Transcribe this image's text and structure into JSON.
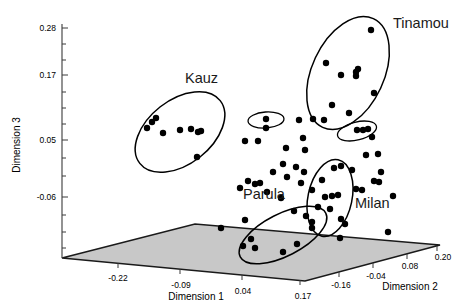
{
  "chart_data": {
    "type": "scatter",
    "title": "",
    "projection": "3d",
    "xlabel": "Dimension 1",
    "ylabel": "Dimension 2",
    "zlabel": "Dimension 3",
    "axes": {
      "dimension_1": {
        "label": "Dimension 1",
        "ticks": [
          "-0.22",
          "-0.09",
          "0.04",
          "0.17"
        ]
      },
      "dimension_2": {
        "label": "Dimension 2",
        "ticks": [
          "-0.16",
          "-0.04",
          "0.08",
          "0.20"
        ]
      },
      "dimension_3": {
        "label": "Dimension 3",
        "ticks": [
          "0.28",
          "0.17",
          "0.05",
          "-0.06"
        ]
      }
    },
    "grid": false,
    "legend_position": "none",
    "floor_plane": {
      "visible": true,
      "color": "#c8c8c8"
    },
    "marker": {
      "shape": "circle",
      "color": "#000000",
      "size": 3.2
    },
    "cluster_labels": [
      "Kauz",
      "Tinamou",
      "Parula",
      "Milan"
    ],
    "clusters": [
      {
        "name": "Kauz",
        "label": "Kauz",
        "label_pos": [
          185,
          83
        ],
        "ellipse": {
          "cx": 180,
          "cy": 132,
          "rx": 51,
          "ry": 32,
          "rotation": -38
        },
        "points": [
          [
            152,
            122
          ],
          [
            156,
            118
          ],
          [
            147,
            128
          ],
          [
            163,
            133
          ],
          [
            180,
            130
          ],
          [
            191,
            129
          ],
          [
            198,
            132
          ],
          [
            201,
            131
          ],
          [
            197,
            157
          ]
        ]
      },
      {
        "name": "Tinamou",
        "label": "Tinamou",
        "label_pos": [
          393,
          28
        ],
        "ellipse": {
          "cx": 348,
          "cy": 73,
          "rx": 36,
          "ry": 60,
          "rotation": 25
        },
        "points": [
          [
            371,
            30
          ],
          [
            326,
            63
          ],
          [
            356,
            72
          ],
          [
            358,
            69
          ],
          [
            356,
            76
          ],
          [
            341,
            75
          ],
          [
            374,
            93
          ],
          [
            332,
            105
          ],
          [
            349,
            113
          ],
          [
            324,
            120
          ],
          [
            313,
            119
          ]
        ]
      },
      {
        "name": "Parula",
        "label": "Parula",
        "label_pos": [
          243,
          199
        ],
        "ellipse": {
          "cx": 283,
          "cy": 235,
          "rx": 48,
          "ry": 21,
          "rotation": -27
        },
        "points": [
          [
            245,
            220
          ],
          [
            251,
            239
          ],
          [
            243,
            246
          ],
          [
            255,
            248
          ],
          [
            283,
            252
          ],
          [
            297,
            244
          ],
          [
            312,
            228
          ]
        ]
      },
      {
        "name": "Milan",
        "label": "Milan",
        "label_pos": [
          355,
          208
        ],
        "ellipse": {
          "cx": 330,
          "cy": 198,
          "rx": 22,
          "ry": 39,
          "rotation": 12
        },
        "points": [
          [
            334,
            168
          ],
          [
            341,
            166
          ],
          [
            322,
            180
          ],
          [
            312,
            190
          ],
          [
            325,
            197
          ],
          [
            332,
            196
          ],
          [
            338,
            195
          ],
          [
            318,
            207
          ],
          [
            330,
            209
          ],
          [
            312,
            222
          ],
          [
            341,
            219
          ],
          [
            345,
            224
          ]
        ]
      }
    ],
    "unlabeled_ellipses": [
      {
        "cx": 266,
        "cy": 120,
        "rx": 18,
        "ry": 8,
        "rotation": -4
      },
      {
        "cx": 357,
        "cy": 131,
        "rx": 20,
        "ry": 9,
        "rotation": -14
      }
    ],
    "scatter_points": [
      [
        266,
        119
      ],
      [
        266,
        128
      ],
      [
        245,
        141
      ],
      [
        258,
        141
      ],
      [
        299,
        120
      ],
      [
        303,
        138
      ],
      [
        286,
        148
      ],
      [
        305,
        150
      ],
      [
        357,
        130
      ],
      [
        363,
        130
      ],
      [
        368,
        129
      ],
      [
        372,
        137
      ],
      [
        283,
        164
      ],
      [
        273,
        172
      ],
      [
        296,
        167
      ],
      [
        287,
        177
      ],
      [
        248,
        181
      ],
      [
        255,
        184
      ],
      [
        260,
        183
      ],
      [
        240,
        188
      ],
      [
        267,
        192
      ],
      [
        281,
        198
      ],
      [
        301,
        183
      ],
      [
        304,
        172
      ],
      [
        352,
        170
      ],
      [
        366,
        155
      ],
      [
        378,
        154
      ],
      [
        381,
        172
      ],
      [
        374,
        181
      ],
      [
        379,
        182
      ],
      [
        294,
        211
      ],
      [
        356,
        189
      ],
      [
        362,
        190
      ],
      [
        393,
        196
      ],
      [
        221,
        228
      ],
      [
        340,
        238
      ],
      [
        388,
        232
      ],
      [
        306,
        216
      ]
    ]
  }
}
